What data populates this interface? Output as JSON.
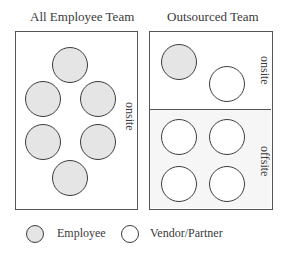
{
  "diagram": {
    "left_panel": {
      "title": "All Employee Team",
      "sections": [
        {
          "label": "onsite",
          "members": [
            "employee",
            "employee",
            "employee",
            "employee",
            "employee",
            "employee"
          ]
        }
      ]
    },
    "right_panel": {
      "title": "Outsourced Team",
      "sections": [
        {
          "label": "onsite",
          "members": [
            "employee",
            "vendor"
          ]
        },
        {
          "label": "offsite",
          "members": [
            "vendor",
            "vendor",
            "vendor",
            "vendor"
          ]
        }
      ]
    },
    "legend": [
      {
        "key": "employee",
        "label": "Employee"
      },
      {
        "key": "vendor",
        "label": "Vendor/Partner"
      }
    ],
    "colors": {
      "employee_fill": "#e5e5e5",
      "vendor_fill": "#ffffff",
      "offsite_background": "#f6f6f6",
      "border": "#555555"
    }
  }
}
